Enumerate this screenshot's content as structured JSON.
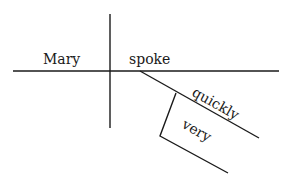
{
  "diagram": {
    "type": "sentence-diagram",
    "sentence": "Mary spoke very quickly",
    "subject": "Mary",
    "verb": "spoke",
    "modifiers": [
      {
        "word": "quickly",
        "modifies": "spoke",
        "role": "adverb"
      },
      {
        "word": "very",
        "modifies": "quickly",
        "role": "adverb"
      }
    ],
    "line_color": "#1a1a1a",
    "text_color": "#1a1a1a"
  }
}
